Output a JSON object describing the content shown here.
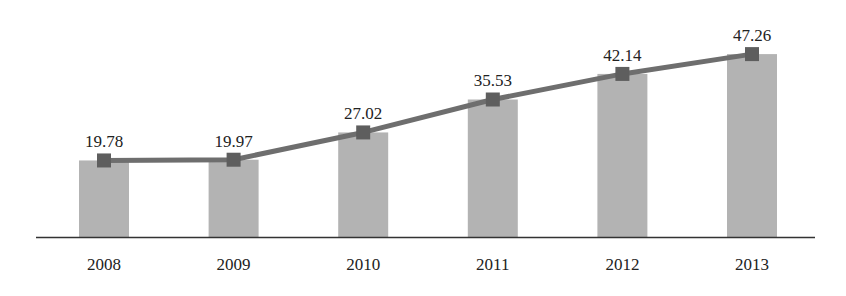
{
  "chart_data": {
    "type": "bar+line",
    "title": "",
    "xlabel": "",
    "ylabel": "",
    "categories": [
      "2008",
      "2009",
      "2010",
      "2011",
      "2012",
      "2013"
    ],
    "series": [
      {
        "name": "bars",
        "type": "bar",
        "values": [
          19.78,
          19.97,
          27.02,
          35.53,
          42.14,
          47.26
        ]
      },
      {
        "name": "line",
        "type": "line",
        "marker": "square",
        "values": [
          19.78,
          19.97,
          27.02,
          35.53,
          42.14,
          47.26
        ]
      }
    ],
    "data_labels": [
      "19.78",
      "19.97",
      "27.02",
      "35.53",
      "42.14",
      "47.26"
    ],
    "ylim": [
      0,
      50
    ],
    "grid": false,
    "legend": "none",
    "colors": {
      "bar": "#b3b3b3",
      "line": "#6e6e6e",
      "marker": "#5e5e5e",
      "axis": "#333333",
      "text": "#222222"
    }
  }
}
